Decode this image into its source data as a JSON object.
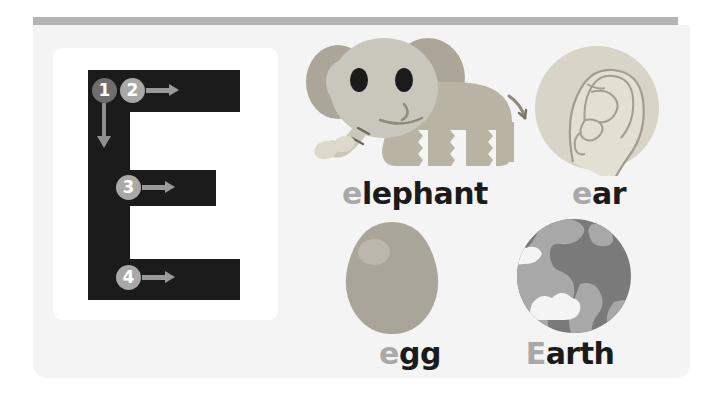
{
  "page": {
    "letter_uppercase": "E",
    "background_color": "#f4f4f4",
    "top_bar_color": "#b4b4b4",
    "letter_color": "#1b1b1b",
    "highlight_color": "#a9a9a9"
  },
  "stroke_guide": {
    "title": "Letter E stroke order",
    "strokes": [
      {
        "number": "1",
        "direction": "down",
        "badge_color": "#6e6e6e"
      },
      {
        "number": "2",
        "direction": "right",
        "badge_color": "#a8a8a8"
      },
      {
        "number": "3",
        "direction": "right",
        "badge_color": "#a8a8a8"
      },
      {
        "number": "4",
        "direction": "right",
        "badge_color": "#a8a8a8"
      }
    ]
  },
  "words": [
    {
      "id": "elephant",
      "icon": "elephant-icon",
      "caption_highlight": "e",
      "caption_rest": "lephant",
      "caption_full": "elephant",
      "colors": {
        "body": "#b9b3a3",
        "head": "#c9c6bb",
        "ear": "#aaa595",
        "eye": "#1b1b1b",
        "peanut": "#ddd9cc"
      }
    },
    {
      "id": "ear",
      "icon": "ear-icon",
      "caption_highlight": "e",
      "caption_rest": "ar",
      "caption_full": "ear",
      "colors": {
        "circle": "#d9d4c8",
        "skin": "#e2ded2",
        "line": "#a39d8f"
      }
    },
    {
      "id": "egg",
      "icon": "egg-icon",
      "caption_highlight": "e",
      "caption_rest": "gg",
      "caption_full": "egg",
      "colors": {
        "shell": "#a9a59a",
        "highlight": "#c0bcb2"
      }
    },
    {
      "id": "earth",
      "icon": "earth-icon",
      "caption_highlight": "E",
      "caption_rest": "arth",
      "caption_full": "Earth",
      "colors": {
        "ocean": "#7a7a7a",
        "land": "#a8a8a8",
        "cloud": "#f4f4f4"
      }
    }
  ]
}
